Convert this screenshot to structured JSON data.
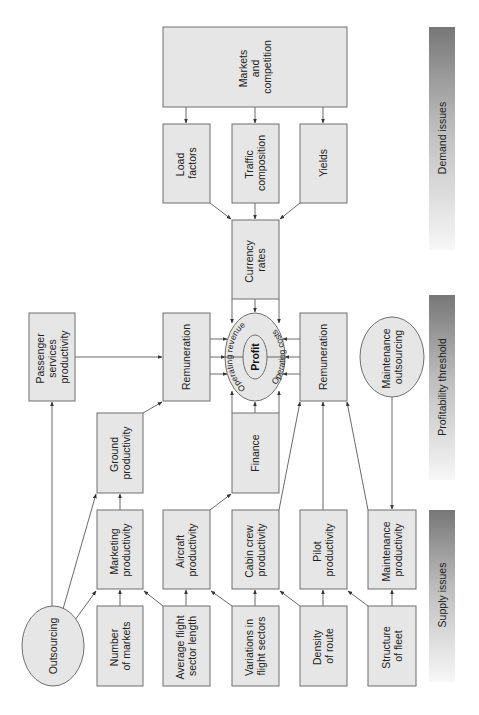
{
  "diagram": {
    "type": "flowchart",
    "orientation": "rotated-90-ccw",
    "bands": {
      "demand": "Demand issues",
      "profitability": "Profitability threshold",
      "supply": "Supply issues"
    },
    "center": {
      "profit": "Profit",
      "operating_revenue": "Operating revenue",
      "operating_costs": "Operating costs"
    },
    "nodes": {
      "markets_competition": [
        "Markets",
        "and",
        "competition"
      ],
      "load_factors": [
        "Load",
        "factors"
      ],
      "traffic_composition": [
        "Traffic",
        "composition"
      ],
      "yields": [
        "Yields"
      ],
      "currency_rates": [
        "Currency",
        "rates"
      ],
      "passenger_services": [
        "Passenger",
        "services",
        "productivity"
      ],
      "remuneration_top": [
        "Remuneration"
      ],
      "remuneration_bottom": [
        "Remuneration"
      ],
      "maintenance_outsourcing": [
        "Maintenance",
        "outsourcing"
      ],
      "ground_productivity": [
        "Ground",
        "productivity"
      ],
      "finance": [
        "Finance"
      ],
      "marketing_productivity": [
        "Marketing",
        "productivity"
      ],
      "aircraft_productivity": [
        "Aircraft",
        "productivity"
      ],
      "cabin_crew_productivity": [
        "Cabin crew",
        "productivity"
      ],
      "pilot_productivity": [
        "Pilot",
        "productivity"
      ],
      "maintenance_productivity": [
        "Maintenance",
        "productivity"
      ],
      "outsourcing": [
        "Outsourcing"
      ],
      "number_of_markets": [
        "Number",
        "of markets"
      ],
      "avg_flight_sector": [
        "Average flight",
        "sector length"
      ],
      "variations_flight_sectors": [
        "Variations in",
        "flight sectors"
      ],
      "density_of_route": [
        "Density",
        "of route"
      ],
      "structure_of_fleet": [
        "Structure",
        "of fleet"
      ]
    },
    "colors": {
      "box_fill": "#e6e6e6",
      "box_stroke": "#6e6e6e",
      "band_dark": "#7a7a7a",
      "band_light": "#f2f2f2"
    }
  }
}
